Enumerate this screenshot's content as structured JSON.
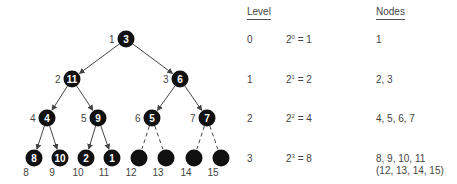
{
  "tree": {
    "nodes": [
      {
        "index": "1",
        "value": "3",
        "x": 126,
        "y": 39
      },
      {
        "index": "2",
        "value": "11",
        "x": 72,
        "y": 79
      },
      {
        "index": "3",
        "value": "6",
        "x": 180,
        "y": 79
      },
      {
        "index": "4",
        "value": "4",
        "x": 47,
        "y": 118
      },
      {
        "index": "5",
        "value": "9",
        "x": 98,
        "y": 118
      },
      {
        "index": "6",
        "value": "5",
        "x": 152,
        "y": 118
      },
      {
        "index": "7",
        "value": "7",
        "x": 207,
        "y": 118
      },
      {
        "index": "8",
        "value": "8",
        "x": 34,
        "y": 158
      },
      {
        "index": "9",
        "value": "10",
        "x": 60,
        "y": 158
      },
      {
        "index": "10",
        "value": "2",
        "x": 86,
        "y": 158
      },
      {
        "index": "11",
        "value": "1",
        "x": 112,
        "y": 158
      },
      {
        "index": "12",
        "value": "",
        "x": 139,
        "y": 158
      },
      {
        "index": "13",
        "value": "",
        "x": 166,
        "y": 158
      },
      {
        "index": "14",
        "value": "",
        "x": 194,
        "y": 158
      },
      {
        "index": "15",
        "value": "",
        "x": 221,
        "y": 158
      }
    ],
    "edges": [
      {
        "from": 0,
        "to": 1,
        "style": "solid"
      },
      {
        "from": 0,
        "to": 2,
        "style": "solid"
      },
      {
        "from": 1,
        "to": 3,
        "style": "solid"
      },
      {
        "from": 1,
        "to": 4,
        "style": "solid"
      },
      {
        "from": 2,
        "to": 5,
        "style": "solid"
      },
      {
        "from": 2,
        "to": 6,
        "style": "solid"
      },
      {
        "from": 3,
        "to": 7,
        "style": "solid"
      },
      {
        "from": 3,
        "to": 8,
        "style": "solid"
      },
      {
        "from": 4,
        "to": 9,
        "style": "solid"
      },
      {
        "from": 4,
        "to": 10,
        "style": "solid"
      },
      {
        "from": 5,
        "to": 11,
        "style": "dashed"
      },
      {
        "from": 5,
        "to": 12,
        "style": "dashed"
      },
      {
        "from": 6,
        "to": 13,
        "style": "dashed"
      },
      {
        "from": 6,
        "to": 14,
        "style": "dashed"
      }
    ],
    "colors": {
      "node_fill": "#111111",
      "edge": "#444444",
      "text": "#ffffff"
    }
  },
  "table": {
    "headers": {
      "level": "Level",
      "nodes": "Nodes"
    },
    "rows": [
      {
        "level": "0",
        "base": "2",
        "exp": "0",
        "result": "= 1",
        "nodes": "1",
        "nodes2": ""
      },
      {
        "level": "1",
        "base": "2",
        "exp": "1",
        "result": "= 2",
        "nodes": "2, 3",
        "nodes2": ""
      },
      {
        "level": "2",
        "base": "2",
        "exp": "2",
        "result": "= 4",
        "nodes": "4, 5, 6, 7",
        "nodes2": ""
      },
      {
        "level": "3",
        "base": "2",
        "exp": "3",
        "result": "= 8",
        "nodes": "8, 9, 10, 11",
        "nodes2": "(12, 13, 14, 15)"
      }
    ]
  }
}
